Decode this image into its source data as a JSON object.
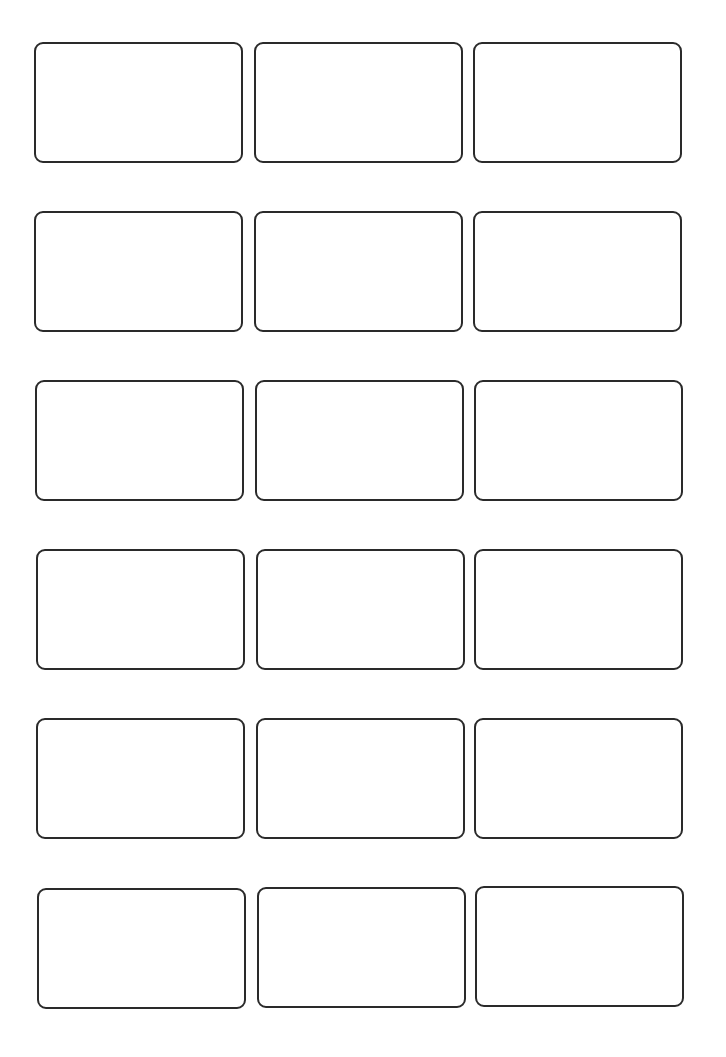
{
  "sheet": {
    "type": "label-template",
    "columns": 3,
    "rows": 6,
    "border_color": "#2a2a2a",
    "labels": [
      {
        "row": 1,
        "col": 1,
        "x": 34,
        "y": 42,
        "text": ""
      },
      {
        "row": 1,
        "col": 2,
        "x": 254,
        "y": 42,
        "text": ""
      },
      {
        "row": 1,
        "col": 3,
        "x": 473,
        "y": 42,
        "text": ""
      },
      {
        "row": 2,
        "col": 1,
        "x": 34,
        "y": 211,
        "text": ""
      },
      {
        "row": 2,
        "col": 2,
        "x": 254,
        "y": 211,
        "text": ""
      },
      {
        "row": 2,
        "col": 3,
        "x": 473,
        "y": 211,
        "text": ""
      },
      {
        "row": 3,
        "col": 1,
        "x": 35,
        "y": 380,
        "text": ""
      },
      {
        "row": 3,
        "col": 2,
        "x": 255,
        "y": 380,
        "text": ""
      },
      {
        "row": 3,
        "col": 3,
        "x": 474,
        "y": 380,
        "text": ""
      },
      {
        "row": 4,
        "col": 1,
        "x": 36,
        "y": 549,
        "text": ""
      },
      {
        "row": 4,
        "col": 2,
        "x": 256,
        "y": 549,
        "text": ""
      },
      {
        "row": 4,
        "col": 3,
        "x": 474,
        "y": 549,
        "text": ""
      },
      {
        "row": 5,
        "col": 1,
        "x": 36,
        "y": 718,
        "text": ""
      },
      {
        "row": 5,
        "col": 2,
        "x": 256,
        "y": 718,
        "text": ""
      },
      {
        "row": 5,
        "col": 3,
        "x": 474,
        "y": 718,
        "text": ""
      },
      {
        "row": 6,
        "col": 1,
        "x": 37,
        "y": 888,
        "text": ""
      },
      {
        "row": 6,
        "col": 2,
        "x": 257,
        "y": 887,
        "text": ""
      },
      {
        "row": 6,
        "col": 3,
        "x": 475,
        "y": 886,
        "text": ""
      }
    ]
  }
}
